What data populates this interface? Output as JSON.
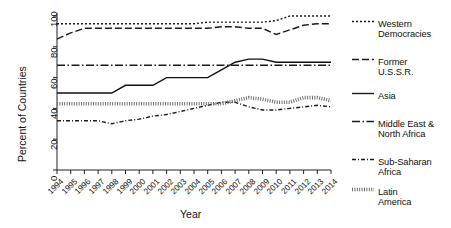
{
  "chart_data": {
    "type": "line",
    "title": "",
    "xlabel": "Year",
    "ylabel": "Percent of Countries",
    "xlim": [
      1994,
      2014
    ],
    "ylim": [
      0,
      100
    ],
    "grid": false,
    "legend_position": "right",
    "x": [
      1994,
      1995,
      1996,
      1997,
      1998,
      1999,
      2000,
      2001,
      2002,
      2003,
      2004,
      2005,
      2006,
      2007,
      2008,
      2009,
      2010,
      2011,
      2012,
      2013,
      2014
    ],
    "xtick_labels": [
      "1994",
      "1995",
      "1996",
      "1997",
      "1998",
      "1999",
      "2000",
      "2001",
      "2002",
      "2003",
      "2004",
      "2005",
      "2006",
      "2007",
      "2008",
      "2009",
      "2010",
      "2011",
      "2012",
      "2013",
      "2014"
    ],
    "ytick_labels": [
      "0",
      "20",
      "40",
      "60",
      "80",
      "100"
    ],
    "ytick_values": [
      0,
      20,
      40,
      60,
      80,
      100
    ],
    "series": [
      {
        "name": "Western Democracies",
        "style": "dotted",
        "color": "#1a1a1a",
        "values": [
          95,
          95,
          95,
          95,
          95,
          95,
          95,
          95,
          95,
          95,
          95,
          96,
          96,
          96,
          96,
          96,
          97,
          100,
          100,
          100,
          100
        ]
      },
      {
        "name": "Former U.S.S.R.",
        "style": "dashed",
        "color": "#1a1a1a",
        "values": [
          85,
          89,
          92,
          92,
          92,
          92,
          92,
          92,
          92,
          92,
          92,
          92,
          93,
          93,
          92,
          92,
          88,
          91,
          94,
          95,
          95
        ]
      },
      {
        "name": "Asia",
        "style": "solid",
        "color": "#111111",
        "values": [
          50,
          50,
          50,
          50,
          50,
          55,
          55,
          55,
          60,
          60,
          60,
          60,
          65,
          70,
          72,
          72,
          70,
          70,
          70,
          70,
          70
        ]
      },
      {
        "name": "Middle East & North Africa",
        "style": "dashdot",
        "color": "#1a1a1a",
        "values": [
          68,
          68,
          68,
          68,
          68,
          68,
          68,
          68,
          68,
          68,
          68,
          68,
          68,
          68,
          68,
          68,
          68,
          68,
          68,
          68,
          68
        ]
      },
      {
        "name": "Sub-Saharan Africa",
        "style": "dashdotdotted",
        "color": "#1a1a1a",
        "values": [
          32,
          32,
          32,
          32,
          30,
          32,
          33,
          35,
          36,
          38,
          40,
          42,
          44,
          44,
          41,
          39,
          39,
          40,
          41,
          42,
          41
        ]
      },
      {
        "name": "Latin America",
        "style": "hatched",
        "color": "#6e6e6e",
        "values": [
          43,
          43,
          43,
          43,
          43,
          43,
          43,
          43,
          43,
          43,
          43,
          43,
          43,
          45,
          47,
          46,
          44,
          44,
          47,
          47,
          45
        ]
      }
    ]
  },
  "legend": {
    "entries": [
      {
        "label": "Western\nDemocracies",
        "style": "dotted"
      },
      {
        "label": "Former\nU.S.S.R.",
        "style": "dashed"
      },
      {
        "label": "Asia",
        "style": "solid"
      },
      {
        "label": "Middle East &\nNorth Africa",
        "style": "dashdot"
      },
      {
        "label": "Sub-Saharan\nAfrica",
        "style": "dashdotdotted"
      },
      {
        "label": "Latin\nAmerica",
        "style": "hatched"
      }
    ]
  }
}
